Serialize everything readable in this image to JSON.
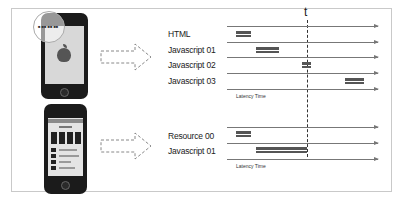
{
  "diagram": {
    "top_group": {
      "time_marker": "t",
      "rows": [
        {
          "label": "HTML"
        },
        {
          "label": "Javascript 01"
        },
        {
          "label": "Javascript 02"
        },
        {
          "label": "Javascript 03"
        }
      ],
      "axis_label": "Latency Time",
      "phone": {
        "magnifier_text": "■ ■■ ■■ ■■"
      }
    },
    "bottom_group": {
      "rows": [
        {
          "label": "Resource 00"
        },
        {
          "label": "Javascript 01"
        }
      ],
      "axis_label": "Latency Time"
    },
    "colors": {
      "bar": "#555555",
      "line": "#777777",
      "frame": "#c9c9c9"
    }
  }
}
